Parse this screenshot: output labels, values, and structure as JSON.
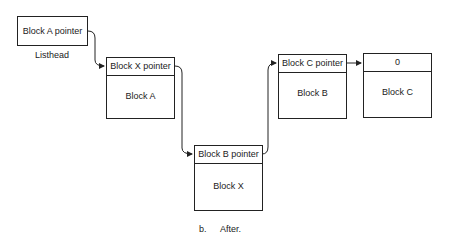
{
  "listhead": {
    "pointer": "Block A pointer",
    "label": "Listhead"
  },
  "blocks": [
    {
      "id": "A",
      "pointer": "Block X pointer",
      "name": "Block A"
    },
    {
      "id": "X",
      "pointer": "Block B pointer",
      "name": "Block X"
    },
    {
      "id": "B",
      "pointer": "Block C pointer",
      "name": "Block B"
    },
    {
      "id": "C",
      "pointer": "0",
      "name": "Block C"
    }
  ],
  "caption": {
    "letter": "b.",
    "text": "After."
  }
}
